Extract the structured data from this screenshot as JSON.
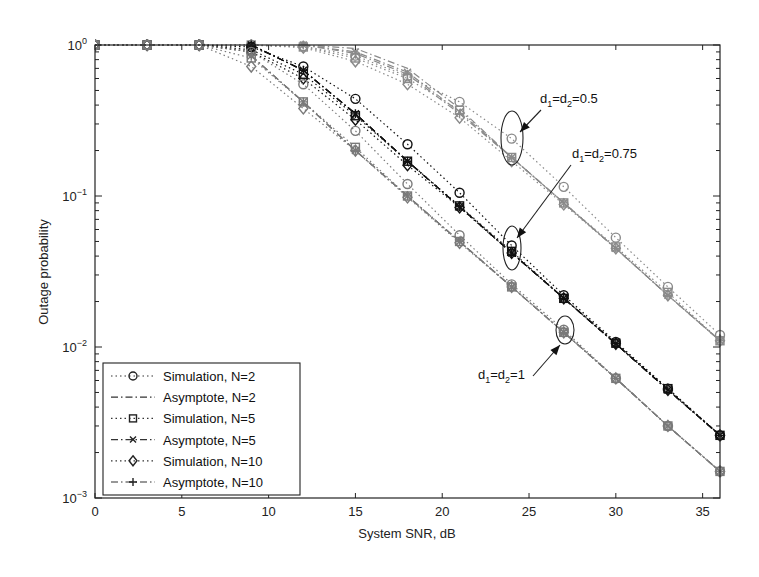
{
  "chart_data": {
    "type": "line",
    "title": "",
    "xlabel": "System SNR, dB",
    "ylabel": "Outage probability",
    "xlim": [
      0,
      36
    ],
    "ylim": [
      0.001,
      1
    ],
    "yscale": "log",
    "x_ticks": [
      0,
      5,
      10,
      15,
      20,
      25,
      30,
      35
    ],
    "y_ticks": [
      "10^0",
      "10^-1",
      "10^-2",
      "10^-3"
    ],
    "grid": false,
    "legend_position": "lower left",
    "legend": [
      {
        "label": "Simulation, N=2",
        "marker": "circle",
        "style": "dotted"
      },
      {
        "label": "Asymptote, N=2",
        "marker": "none",
        "style": "dashdot"
      },
      {
        "label": "Simulation, N=5",
        "marker": "square",
        "style": "dotted"
      },
      {
        "label": "Asymptote, N=5",
        "marker": "x",
        "style": "dashdot"
      },
      {
        "label": "Simulation, N=10",
        "marker": "diamond",
        "style": "dotted"
      },
      {
        "label": "Asymptote, N=10",
        "marker": "plus",
        "style": "dashdot"
      }
    ],
    "x": [
      0,
      3,
      6,
      9,
      12,
      15,
      18,
      21,
      24,
      27,
      30,
      33,
      36
    ],
    "groups": [
      {
        "name": "d1=d2=0.5",
        "color": "#8a8a8a",
        "series": [
          {
            "name": "Simulation, N=2",
            "values": [
              1,
              1,
              1,
              1,
              0.98,
              0.85,
              0.62,
              0.42,
              0.24,
              0.115,
              0.053,
              0.025,
              0.012
            ]
          },
          {
            "name": "Asymptote, N=2",
            "values": [
              null,
              null,
              null,
              null,
              1,
              0.95,
              0.7,
              0.38,
              0.18,
              0.09,
              0.045,
              0.022,
              0.011
            ]
          },
          {
            "name": "Simulation, N=5",
            "values": [
              1,
              1,
              1,
              1,
              0.97,
              0.82,
              0.6,
              0.37,
              0.18,
              0.09,
              0.046,
              0.023,
              0.011
            ]
          },
          {
            "name": "Asymptote, N=5",
            "values": [
              null,
              null,
              null,
              null,
              1,
              0.9,
              0.66,
              0.36,
              0.18,
              0.09,
              0.045,
              0.022,
              0.011
            ]
          },
          {
            "name": "Simulation, N=10",
            "values": [
              1,
              1,
              1,
              1,
              0.96,
              0.78,
              0.55,
              0.33,
              0.17,
              0.088,
              0.045,
              0.022,
              0.011
            ]
          },
          {
            "name": "Asymptote, N=10",
            "values": [
              null,
              null,
              null,
              null,
              1,
              0.88,
              0.64,
              0.35,
              0.18,
              0.09,
              0.045,
              0.022,
              0.011
            ]
          }
        ]
      },
      {
        "name": "d1=d2=0.75",
        "color": "#111111",
        "series": [
          {
            "name": "Simulation, N=2",
            "values": [
              1,
              1,
              1,
              0.97,
              0.72,
              0.44,
              0.22,
              0.105,
              0.047,
              0.022,
              0.0108,
              0.0053,
              0.0026
            ]
          },
          {
            "name": "Asymptote, N=2",
            "values": [
              null,
              null,
              null,
              1,
              0.68,
              0.35,
              0.17,
              0.085,
              0.042,
              0.021,
              0.0105,
              0.0052,
              0.0026
            ]
          },
          {
            "name": "Simulation, N=5",
            "values": [
              1,
              1,
              1,
              0.93,
              0.64,
              0.34,
              0.17,
              0.086,
              0.043,
              0.021,
              0.0106,
              0.0053,
              0.0026
            ]
          },
          {
            "name": "Asymptote, N=5",
            "values": [
              null,
              null,
              null,
              1,
              0.68,
              0.35,
              0.17,
              0.085,
              0.042,
              0.021,
              0.0105,
              0.0052,
              0.0026
            ]
          },
          {
            "name": "Simulation, N=10",
            "values": [
              1,
              1,
              1,
              0.9,
              0.6,
              0.32,
              0.16,
              0.084,
              0.042,
              0.021,
              0.0105,
              0.0052,
              0.0026
            ]
          },
          {
            "name": "Asymptote, N=10",
            "values": [
              null,
              null,
              null,
              1,
              0.68,
              0.35,
              0.17,
              0.085,
              0.042,
              0.021,
              0.0105,
              0.0052,
              0.0026
            ]
          }
        ]
      },
      {
        "name": "d1=d2=1",
        "color": "#7a7a7a",
        "series": [
          {
            "name": "Simulation, N=2",
            "values": [
              1,
              1,
              1,
              0.9,
              0.55,
              0.27,
              0.12,
              0.055,
              0.026,
              0.013,
              0.0062,
              0.003,
              0.0015
            ]
          },
          {
            "name": "Asymptote, N=2",
            "values": [
              null,
              null,
              null,
              0.85,
              0.42,
              0.2,
              0.1,
              0.05,
              0.025,
              0.0125,
              0.0062,
              0.003,
              0.0015
            ]
          },
          {
            "name": "Simulation, N=5",
            "values": [
              1,
              1,
              1,
              0.82,
              0.42,
              0.21,
              0.1,
              0.05,
              0.025,
              0.0125,
              0.0062,
              0.003,
              0.0015
            ]
          },
          {
            "name": "Asymptote, N=5",
            "values": [
              null,
              null,
              null,
              0.85,
              0.42,
              0.2,
              0.1,
              0.05,
              0.025,
              0.0125,
              0.0062,
              0.003,
              0.0015
            ]
          },
          {
            "name": "Simulation, N=10",
            "values": [
              1,
              1,
              1,
              0.72,
              0.38,
              0.2,
              0.098,
              0.049,
              0.025,
              0.0125,
              0.0062,
              0.003,
              0.0015
            ]
          },
          {
            "name": "Asymptote, N=10",
            "values": [
              null,
              null,
              null,
              0.85,
              0.42,
              0.2,
              0.1,
              0.05,
              0.025,
              0.0125,
              0.0062,
              0.003,
              0.0015
            ]
          }
        ]
      }
    ],
    "annotations": [
      {
        "text_main": "d",
        "sub1": "1",
        "eq": "=d",
        "sub2": "2",
        "value": "=0.5",
        "target_x": 24,
        "target_y": 0.24
      },
      {
        "text_main": "d",
        "sub1": "1",
        "eq": "=d",
        "sub2": "2",
        "value": "=0.75",
        "target_x": 24,
        "target_y": 0.047
      },
      {
        "text_main": "d",
        "sub1": "1",
        "eq": "=d",
        "sub2": "2",
        "value": "=1",
        "target_x": 27,
        "target_y": 0.013
      }
    ]
  }
}
